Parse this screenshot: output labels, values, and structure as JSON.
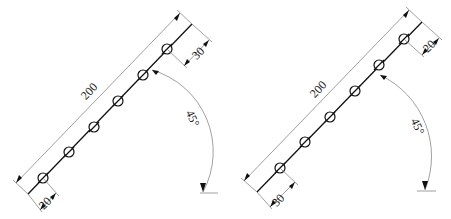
{
  "figures": [
    {
      "id": "left",
      "overall_length_label": "200",
      "top_offset_label": "30",
      "bottom_offset_label": "20",
      "angle_label": "45°",
      "hole_count": 6
    },
    {
      "id": "right",
      "overall_length_label": "200",
      "top_offset_label": "20",
      "bottom_offset_label": "30",
      "angle_label": "45°",
      "hole_count": 6
    }
  ],
  "colors": {
    "line": "#111111",
    "dimension_line": "#777777",
    "background": "#ffffff"
  }
}
